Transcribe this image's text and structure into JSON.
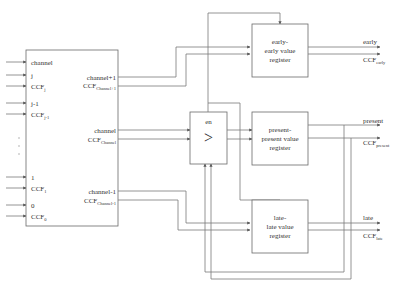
{
  "diagram": {
    "type": "block-diagram",
    "selector_block": {
      "inputs": [
        {
          "label": "channel"
        },
        {
          "label": "j"
        },
        {
          "label": "CCF",
          "sub": "j"
        },
        {
          "label": "j-1"
        },
        {
          "label": "CCF",
          "sub": "j-1"
        },
        {
          "label": "1"
        },
        {
          "label": "CCF",
          "sub": "1"
        },
        {
          "label": "0"
        },
        {
          "label": "CCF",
          "sub": "0"
        }
      ],
      "ellipsis": "⋮",
      "outputs": [
        {
          "label": "channel+1"
        },
        {
          "label": "CCF",
          "sub": "Channel+1"
        },
        {
          "label": "channel"
        },
        {
          "label": "CCF",
          "sub": "Channel"
        },
        {
          "label": "channel-1"
        },
        {
          "label": "CCF",
          "sub": "Channel-1"
        }
      ]
    },
    "comparator": {
      "enable_label": "en",
      "symbol": ">"
    },
    "registers": [
      {
        "line1": "early-",
        "line2": "early value",
        "line3": "register",
        "out_value": "early",
        "out_ccf": "CCF",
        "out_ccf_sub": "early"
      },
      {
        "line1": "present-",
        "line2": "present value",
        "line3": "register",
        "out_value": "present",
        "out_ccf": "CCF",
        "out_ccf_sub": "present"
      },
      {
        "line1": "late-",
        "line2": "late value",
        "line3": "register",
        "out_value": "late",
        "out_ccf": "CCF",
        "out_ccf_sub": "late"
      }
    ],
    "colors": {
      "line": "#7a7a7a",
      "box": "#6a6a6a",
      "text": "#333333",
      "background": "#ffffff"
    }
  }
}
